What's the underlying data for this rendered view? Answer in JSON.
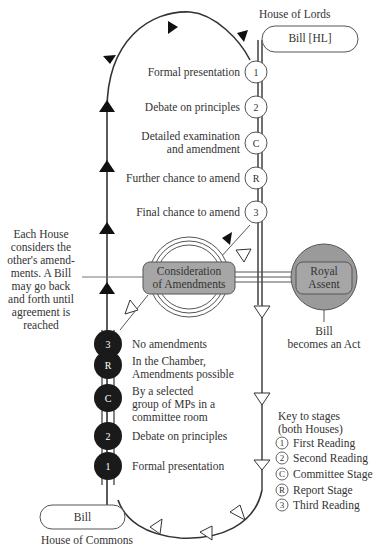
{
  "title_lords": "House of Lords",
  "title_commons": "House of Commons",
  "bill_hl": "Bill [HL]",
  "bill_commons": "Bill",
  "lords_stages": [
    {
      "badge": "1",
      "label": "Formal presentation"
    },
    {
      "badge": "2",
      "label": "Debate on principles"
    },
    {
      "badge": "C",
      "label": "Detailed examination\nand amendment"
    },
    {
      "badge": "R",
      "label": "Further chance to amend"
    },
    {
      "badge": "3",
      "label": "Final chance to amend"
    }
  ],
  "commons_stages": [
    {
      "badge": "3",
      "label": "No amendments"
    },
    {
      "badge": "R",
      "label": "In the Chamber,\nAmendments possible"
    },
    {
      "badge": "C",
      "label": "By a selected\ngroup of MPs in a\ncommittee room"
    },
    {
      "badge": "2",
      "label": "Debate on principles"
    },
    {
      "badge": "1",
      "label": "Formal presentation"
    }
  ],
  "ping_pong_note": "Each House\nconsiders the\nother's amend-\nments. A Bill\nmay go back\nand forth until\nagreement is\nreached",
  "consideration": "Consideration\nof Amendments",
  "royal_assent": "Royal\nAssent",
  "becomes_act": "Bill\nbecomes an Act",
  "key": {
    "title": "Key to stages\n(both Houses)",
    "items": [
      {
        "symbol": "1",
        "label": "First Reading"
      },
      {
        "symbol": "2",
        "label": "Second Reading"
      },
      {
        "symbol": "C",
        "label": "Committee Stage"
      },
      {
        "symbol": "R",
        "label": "Report Stage"
      },
      {
        "symbol": "3",
        "label": "Third Reading"
      }
    ]
  },
  "colors": {
    "line": "#333333",
    "commons_badge": "#1a1a1a",
    "box_fill": "#a6a6a6",
    "royal_circle": "#9a9a9a"
  }
}
